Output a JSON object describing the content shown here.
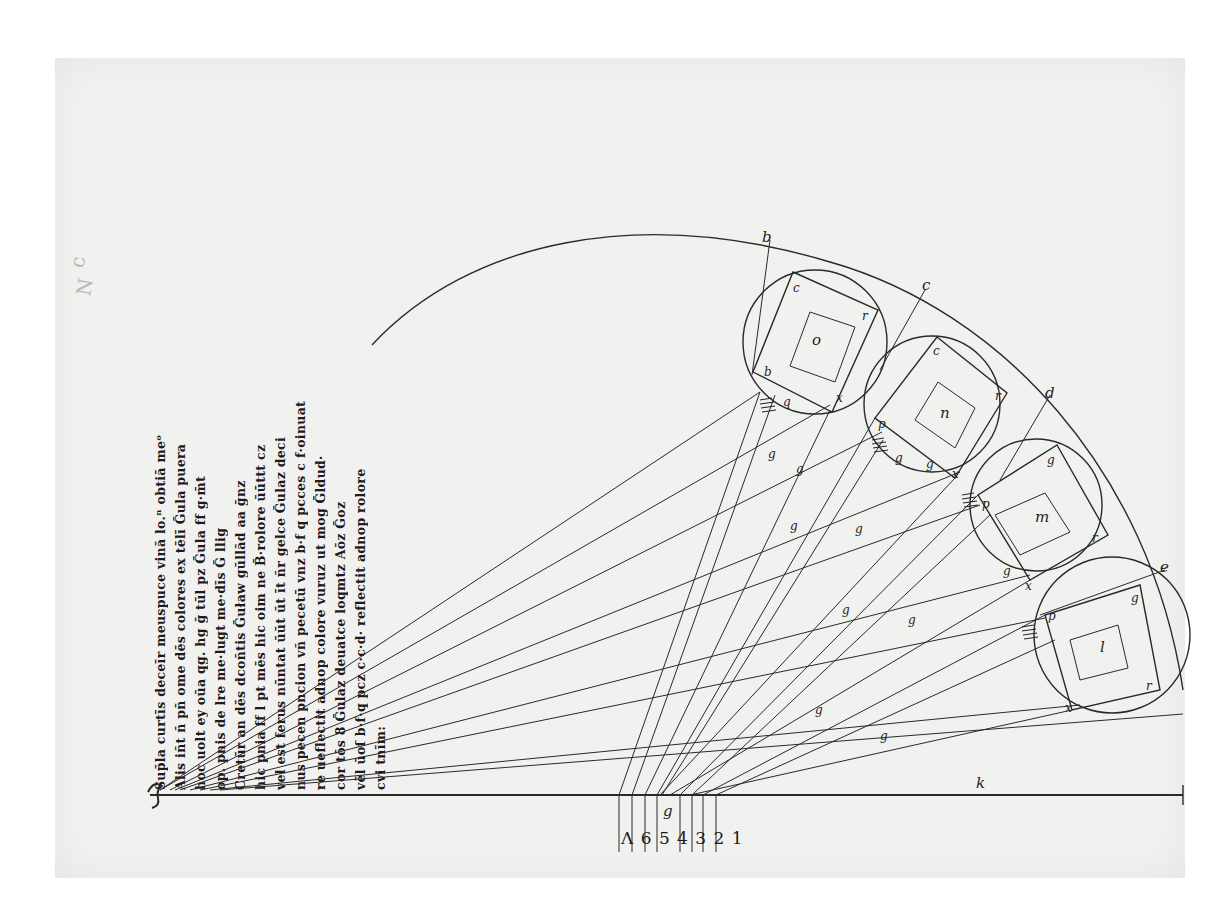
{
  "document": {
    "type": "medieval manuscript folio — geometric optics diagram",
    "paper_color": "#f1f1ef",
    "ink_color": "#2a2a2a"
  },
  "margin_marks": [
    "c",
    "N"
  ],
  "manuscript_text": {
    "orientation": "rotated 90° (reads bottom-to-top)",
    "lines": [
      "Sup̄la curtīs deceīr meuspuce vinā lo.ⁿ obtiā meᵒ",
      "Alis iñt ñ pn̄ ome dēs colores ex tēlī Ḡula puera",
      "hoc uolt ey oūa qg. hg ḡ tūl pz Ḡula ff g·m̄t",
      "op. pnis de lre me·lugt me·dīs Ḡ llig",
      "Cretūr an dēs dcoñtis Ḡuław gūllād aa ḡnz",
      "hic pnia ff l pt mēs hic oim ne B̄·rolore ūūttt cz",
      "vel est ferus nūntat ūūt ūt īt ñr gelce Ḡulaz deci",
      "nus pecen pncion vñ pecetū vnz b·f q pcces c f·oinuat",
      "re ueflectit adnop colore vuruz ut mog Ḡldud·",
      "cor tōs 8 Ḡulaz deuatce loqmtz Aōz Ḡoz",
      "vēl ūoſ b·f·q pcz c·c·d· reflectit adnop rolore",
      "cvi tnīm:"
    ]
  },
  "diagram": {
    "base_line": {
      "label_left": "a",
      "label_mid": "k",
      "label_right": "f"
    },
    "center_point_label": "g",
    "scale_numbers": [
      "8",
      "6",
      "5",
      "4",
      "3",
      "2",
      "1"
    ],
    "scale_numbers_display": "Λ 6 5 4 3 2 1",
    "circles": [
      {
        "name": "o",
        "corners": [
          "c",
          "r",
          "x",
          "q"
        ],
        "side_label": "b"
      },
      {
        "name": "n",
        "corners": [
          "c",
          "r",
          "x",
          "g"
        ],
        "side_label": "p"
      },
      {
        "name": "m",
        "corners": [
          "g",
          "r",
          "x",
          "p"
        ],
        "side_label": "d"
      },
      {
        "name": "l",
        "corners": [
          "g",
          "r",
          "x",
          "p"
        ],
        "side_label": "e"
      }
    ],
    "ray_labels": [
      "g",
      "g",
      "g",
      "g",
      "g",
      "g",
      "g",
      "g",
      "g",
      "g"
    ],
    "outer_arc_labels": [
      "b",
      "c",
      "d",
      "e"
    ]
  }
}
